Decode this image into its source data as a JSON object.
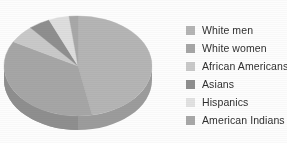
{
  "chart_data": {
    "type": "pie",
    "title": "",
    "xlabel": "",
    "ylabel": "",
    "legend_position": "right",
    "grid": false,
    "three_d": true,
    "start_angle_deg": 0,
    "direction": "clockwise",
    "categories": [
      "White men",
      "White women",
      "African Americans",
      "Asians",
      "Hispanics",
      "American Indians"
    ],
    "values": [
      47,
      36,
      6,
      4,
      5,
      2
    ],
    "unit": "percent",
    "colors": [
      "#b5b5b5",
      "#a6a6a6",
      "#c9c9c9",
      "#8f8f8f",
      "#dedede",
      "#a8a8a8"
    ],
    "slices": [
      {
        "label": "White men",
        "value": 47,
        "color": "#b5b5b5",
        "start_deg": 0,
        "end_deg": 169
      },
      {
        "label": "White women",
        "value": 36,
        "color": "#a6a6a6",
        "start_deg": 169,
        "end_deg": 299
      },
      {
        "label": "African Americans",
        "value": 6,
        "color": "#c9c9c9",
        "start_deg": 299,
        "end_deg": 320
      },
      {
        "label": "Asians",
        "value": 4,
        "color": "#8f8f8f",
        "start_deg": 320,
        "end_deg": 337
      },
      {
        "label": "Hispanics",
        "value": 5,
        "color": "#dedede",
        "start_deg": 337,
        "end_deg": 353
      },
      {
        "label": "American Indians",
        "value": 2,
        "color": "#a8a8a8",
        "start_deg": 353,
        "end_deg": 360
      }
    ]
  },
  "legend": {
    "items": [
      {
        "label": "White men",
        "color": "#b5b5b5"
      },
      {
        "label": "White women",
        "color": "#a6a6a6"
      },
      {
        "label": "African Americans",
        "color": "#c9c9c9"
      },
      {
        "label": "Asians",
        "color": "#8f8f8f"
      },
      {
        "label": "Hispanics",
        "color": "#e2e2e2"
      },
      {
        "label": "American Indians",
        "color": "#a8a8a8"
      }
    ]
  }
}
